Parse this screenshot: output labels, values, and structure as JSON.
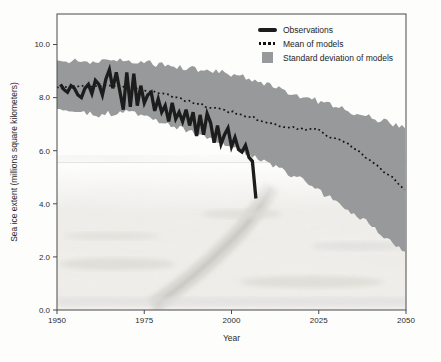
{
  "colors": {
    "band": "#98999a",
    "observations": "#1c1c1c",
    "mean": "#141414",
    "frame": "#4a4a4a",
    "text": "#2b2b2b",
    "photo_base": "#f1efeb"
  },
  "chart_data": {
    "type": "line",
    "title": "",
    "xlabel": "Year",
    "ylabel": "Sea ice extent (millions square kilometers)",
    "xlim": [
      1950,
      2050
    ],
    "ylim": [
      0,
      11.15
    ],
    "grid": false,
    "x_ticks": [
      1950,
      1975,
      2000,
      2025,
      2050
    ],
    "x_tick_labels": [
      "1950",
      "1975",
      "2000",
      "2025",
      "2050"
    ],
    "y_ticks": [
      10,
      8,
      6,
      4,
      2,
      0
    ],
    "y_tick_labels": [
      "10.0",
      "8.0",
      "6.0",
      "4.0",
      "2.0",
      "0.0"
    ],
    "legend": {
      "position": "top-right",
      "items": [
        {
          "label": "Observations",
          "swatch": "thick-line"
        },
        {
          "label": "Mean of models",
          "swatch": "dotted-line"
        },
        {
          "label": "Standard deviation of models",
          "swatch": "filled-square"
        }
      ]
    },
    "series": [
      {
        "name": "Observations",
        "type": "line",
        "style": "solid-thick",
        "color": "#1c1c1c",
        "x": [
          1951,
          1952,
          1953,
          1954,
          1955,
          1956,
          1957,
          1958,
          1959,
          1960,
          1961,
          1962,
          1963,
          1964,
          1965,
          1966,
          1967,
          1968,
          1969,
          1970,
          1971,
          1972,
          1973,
          1974,
          1975,
          1976,
          1977,
          1978,
          1979,
          1980,
          1981,
          1982,
          1983,
          1984,
          1985,
          1986,
          1987,
          1988,
          1989,
          1990,
          1991,
          1992,
          1993,
          1994,
          1995,
          1996,
          1997,
          1998,
          1999,
          2000,
          2001,
          2002,
          2003,
          2004,
          2005,
          2006,
          2007
        ],
        "y": [
          8.5,
          8.3,
          8.2,
          8.45,
          8.35,
          8.1,
          8.0,
          8.35,
          8.5,
          8.15,
          8.65,
          8.5,
          8.1,
          8.7,
          9.05,
          8.35,
          8.95,
          8.25,
          7.55,
          8.95,
          7.65,
          8.9,
          7.7,
          8.45,
          7.8,
          8.1,
          8.2,
          7.5,
          7.95,
          7.45,
          7.7,
          7.1,
          7.8,
          7.2,
          7.45,
          7.1,
          7.55,
          6.95,
          7.45,
          6.55,
          7.35,
          6.6,
          7.4,
          7.05,
          6.3,
          6.95,
          6.25,
          6.6,
          6.85,
          6.15,
          6.5,
          6.05,
          5.95,
          6.2,
          5.75,
          5.6,
          4.2
        ]
      },
      {
        "name": "Mean of models",
        "type": "line",
        "style": "dotted",
        "color": "#141414",
        "x": [
          1950,
          1955,
          1960,
          1965,
          1970,
          1975,
          1980,
          1985,
          1990,
          1995,
          2000,
          2005,
          2010,
          2015,
          2020,
          2024,
          2028,
          2032,
          2036,
          2040,
          2045,
          2050
        ],
        "y": [
          8.35,
          8.4,
          8.45,
          8.5,
          8.4,
          8.3,
          8.15,
          7.95,
          7.8,
          7.6,
          7.45,
          7.3,
          7.1,
          6.9,
          6.8,
          6.85,
          6.5,
          6.35,
          6.0,
          5.6,
          5.1,
          4.55
        ]
      },
      {
        "name": "Standard deviation of models",
        "type": "band",
        "color": "#98999a",
        "x": [
          1950,
          1960,
          1970,
          1980,
          1990,
          2000,
          2010,
          2020,
          2030,
          2040,
          2050
        ],
        "top": [
          9.4,
          9.35,
          9.4,
          9.25,
          9.05,
          8.9,
          8.5,
          8.05,
          7.65,
          7.25,
          6.9
        ],
        "bottom": [
          7.5,
          7.35,
          7.45,
          7.1,
          6.6,
          6.15,
          5.6,
          4.9,
          4.1,
          3.2,
          2.1
        ]
      }
    ],
    "background_photo": {
      "description": "faint grayscale aerial photograph of cracking sea ice in lower plot area",
      "top_value": 5.55
    }
  }
}
